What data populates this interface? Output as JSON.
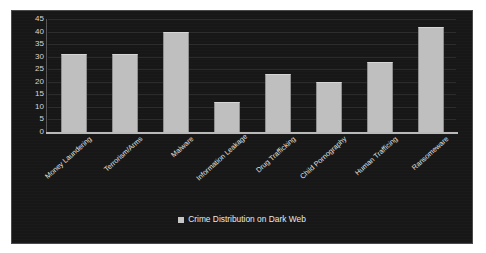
{
  "chart_data": {
    "type": "bar",
    "title": "",
    "xlabel": "",
    "ylabel": "",
    "ylim": [
      0,
      45
    ],
    "yticks": [
      45,
      40,
      35,
      30,
      25,
      20,
      15,
      10,
      5,
      0
    ],
    "grid": true,
    "legend_position": "bottom",
    "categories": [
      "Money Laundering",
      "Terrorism/Arms",
      "Malware",
      "Information Leakage",
      "Drug Trafficking",
      "Child Pornography",
      "Human Trafficing",
      "Ransomeware"
    ],
    "series": [
      {
        "name": "Crime Distribution on Dark Web",
        "values": [
          31,
          31,
          40,
          12,
          23,
          20,
          28,
          42
        ]
      }
    ]
  },
  "legend": {
    "marker": "square-marker",
    "label": "Crime Distribution on Dark Web"
  },
  "colors": {
    "panel_background": "#171717",
    "panel_border": "#4a4a4a",
    "bar_fill": "#bfbfbf",
    "axis_line": "#b9b9b9",
    "tick_text": "#d8d8d8",
    "label_text": "#e2e2e2",
    "page_background": "#ffffff"
  }
}
